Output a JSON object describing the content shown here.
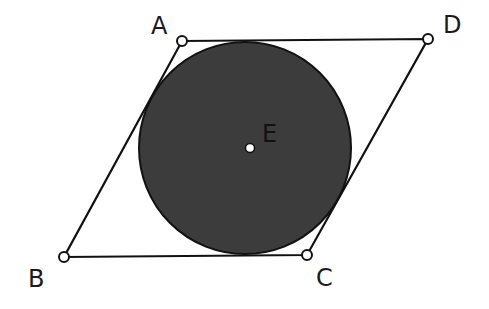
{
  "diagram": {
    "colors": {
      "stroke": "#111111",
      "circle_fill": "#3c3c3c",
      "point_fill": "#ffffff"
    },
    "points": {
      "A": {
        "label": "A",
        "x": 182,
        "y": 41,
        "lx": 151,
        "ly": 34
      },
      "D": {
        "label": "D",
        "x": 428,
        "y": 39,
        "lx": 443,
        "ly": 33
      },
      "B": {
        "label": "B",
        "x": 64,
        "y": 257,
        "lx": 28,
        "ly": 287
      },
      "C": {
        "label": "C",
        "x": 307,
        "y": 255,
        "lx": 316,
        "ly": 286
      },
      "E": {
        "label": "E",
        "x": 250,
        "y": 148,
        "lx": 262,
        "ly": 142
      }
    },
    "circle": {
      "cx": 245,
      "cy": 148,
      "r": 106,
      "center_label": "E"
    },
    "edges": [
      "AD",
      "DC",
      "CB",
      "BA"
    ]
  }
}
